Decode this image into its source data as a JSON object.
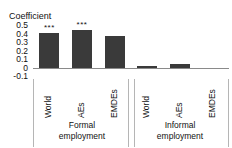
{
  "chart_data": {
    "type": "bar",
    "title": "",
    "ylabel": "Coefficient",
    "xlabel": "",
    "ylim": [
      -0.1,
      0.5
    ],
    "yticks": [
      "0.5",
      "0.4",
      "0.3",
      "0.2",
      "0.1",
      "0",
      "-0.1"
    ],
    "ytick_values": [
      0.5,
      0.4,
      0.3,
      0.2,
      0.1,
      0,
      -0.1
    ],
    "grid": false,
    "legend": "none",
    "bar_color": "#3a3a3a",
    "zero_line_color": "#8a8a8a",
    "categories": [
      "World",
      "AEs",
      "EMDEs"
    ],
    "groups": [
      {
        "caption_line1": "Formal",
        "caption_line2": "employment",
        "bars": [
          {
            "category": "World",
            "value": 0.41,
            "significance": "***"
          },
          {
            "category": "AEs",
            "value": 0.45,
            "significance": "***"
          },
          {
            "category": "EMDEs",
            "value": 0.38,
            "significance": ""
          }
        ]
      },
      {
        "caption_line1": "Informal",
        "caption_line2": "employment",
        "bars": [
          {
            "category": "World",
            "value": 0.02,
            "significance": ""
          },
          {
            "category": "AEs",
            "value": 0.05,
            "significance": ""
          },
          {
            "category": "EMDEs",
            "value": 0.0,
            "significance": ""
          }
        ]
      }
    ]
  }
}
